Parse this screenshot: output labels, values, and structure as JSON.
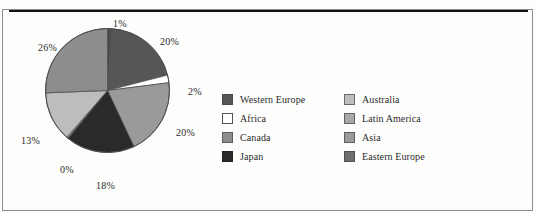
{
  "figure": {
    "background_color": "#fdfdfc",
    "frame_color": "#8d8d8d",
    "rule_color": "#111111"
  },
  "chart_data": {
    "type": "pie",
    "title": "",
    "subtitle": "",
    "xlabel": "",
    "ylabel": "",
    "legend_position": "right",
    "grid": false,
    "start_angle_deg": 0,
    "direction": "clockwise",
    "categories": [
      "Eastern Europe",
      "Western Europe",
      "Africa",
      "Asia",
      "Japan",
      "Latin America",
      "Australia",
      "Canada"
    ],
    "values": [
      1,
      20,
      2,
      20,
      18,
      0,
      13,
      26
    ],
    "value_labels": [
      "1%",
      "20%",
      "2%",
      "20%",
      "18%",
      "0%",
      "13%",
      "26%"
    ],
    "slice_colors": [
      "#4a4a4a",
      "#565656",
      "#ffffff",
      "#9a9a9a",
      "#2a2a2a",
      "#8e8e8e",
      "#bdbdbd",
      "#8d8d8d"
    ],
    "units": "percent",
    "total": 100
  },
  "pie": {
    "center_x": 62.5,
    "center_y": 62.5,
    "radius": 62,
    "outline_color": "#4f4f4f",
    "slices": [
      {
        "name": "eastern-europe",
        "label": "1%",
        "value": 1,
        "color": "#4a4a4a",
        "start_deg": 0,
        "end_deg": 3.6
      },
      {
        "name": "western-europe",
        "label": "20%",
        "value": 20,
        "color": "#565656",
        "start_deg": 3.6,
        "end_deg": 75.6
      },
      {
        "name": "africa",
        "label": "2%",
        "value": 2,
        "color": "#ffffff",
        "start_deg": 75.6,
        "end_deg": 82.8
      },
      {
        "name": "asia",
        "label": "20%",
        "value": 20,
        "color": "#9a9a9a",
        "start_deg": 82.8,
        "end_deg": 154.8
      },
      {
        "name": "japan",
        "label": "18%",
        "value": 18,
        "color": "#2a2a2a",
        "start_deg": 154.8,
        "end_deg": 219.6
      },
      {
        "name": "latin-america",
        "label": "0%",
        "value": 0,
        "color": "#8e8e8e",
        "start_deg": 219.6,
        "end_deg": 221.0
      },
      {
        "name": "australia",
        "label": "13%",
        "value": 13,
        "color": "#bdbdbd",
        "start_deg": 221.0,
        "end_deg": 267.8
      },
      {
        "name": "canada",
        "label": "26%",
        "value": 26,
        "color": "#8d8d8d",
        "start_deg": 267.8,
        "end_deg": 360
      }
    ]
  },
  "pct_labels": [
    {
      "name": "pie-label-1pct",
      "text": "1%",
      "left": 113,
      "top": 18
    },
    {
      "name": "pie-label-20pct-western-europe",
      "text": "20%",
      "left": 160,
      "top": 36
    },
    {
      "name": "pie-label-2pct",
      "text": "2%",
      "left": 188,
      "top": 86
    },
    {
      "name": "pie-label-20pct-asia",
      "text": "20%",
      "left": 176,
      "top": 127
    },
    {
      "name": "pie-label-18pct",
      "text": "18%",
      "left": 96,
      "top": 180
    },
    {
      "name": "pie-label-0pct",
      "text": "0%",
      "left": 60,
      "top": 164
    },
    {
      "name": "pie-label-13pct",
      "text": "13%",
      "left": 21,
      "top": 135
    },
    {
      "name": "pie-label-26pct",
      "text": "26%",
      "left": 38,
      "top": 42
    }
  ],
  "legend": {
    "columns": [
      {
        "name": "legend-column-left",
        "items": [
          {
            "label": "Western Europe",
            "color": "#565656",
            "border": "#4a4a4a",
            "key": "western-europe"
          },
          {
            "label": "Africa",
            "color": "#ffffff",
            "border": "#555555",
            "key": "africa"
          },
          {
            "label": "Canada",
            "color": "#8d8d8d",
            "border": "#5c5c5c",
            "key": "canada"
          },
          {
            "label": "Japan",
            "color": "#2a2a2a",
            "border": "#222222",
            "key": "japan"
          }
        ]
      },
      {
        "name": "legend-column-right",
        "items": [
          {
            "label": "Australia",
            "color": "#bdbdbd",
            "border": "#6a6a6a",
            "key": "australia"
          },
          {
            "label": "Latin America",
            "color": "#a8a8a8",
            "border": "#636363",
            "key": "latin-america"
          },
          {
            "label": "Asia",
            "color": "#9a9a9a",
            "border": "#5e5e5e",
            "key": "asia"
          },
          {
            "label": "Eastern Europe",
            "color": "#6e6e6e",
            "border": "#4f4f4f",
            "key": "eastern-europe"
          }
        ]
      }
    ]
  }
}
